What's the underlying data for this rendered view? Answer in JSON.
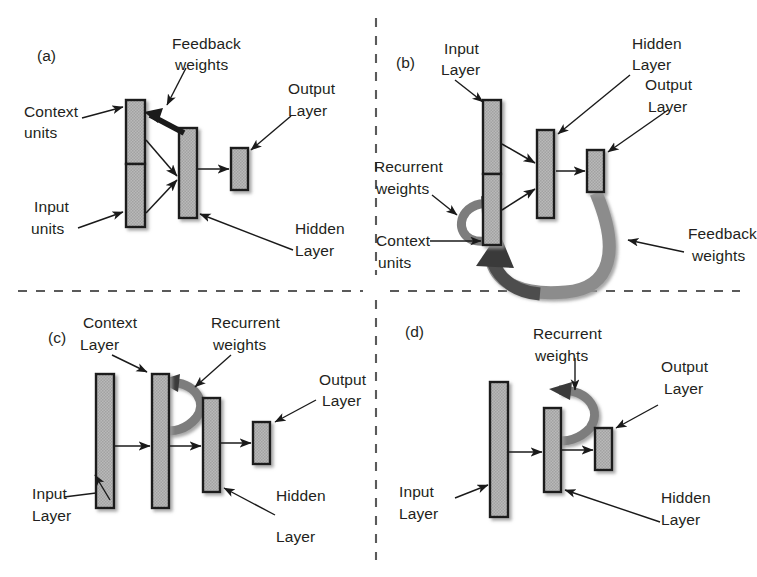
{
  "figure": {
    "background_color": "#ffffff",
    "ink_color": "#231f20",
    "box_fill": "#b3b3b3",
    "box_stroke": "#1a1a1a",
    "ribbon_light": "#8c8c8c",
    "ribbon_dark": "#4d4d4d",
    "divider_style": "dashed",
    "divider_color": "#5a5a5a"
  },
  "panels": [
    {
      "id": "(a)",
      "name": "jordan-network",
      "labels": {
        "context_units_l1": "Context",
        "context_units_l2": "units",
        "input_units_l1": "Input",
        "input_units_l2": "units",
        "feedback_weights_l1": "Feedback",
        "feedback_weights_l2": "weights",
        "output_layer_l1": "Output",
        "output_layer_l2": "Layer",
        "hidden_layer_l1": "Hidden",
        "hidden_layer_l2": "Layer"
      }
    },
    {
      "id": "(b)",
      "name": "jordan-elman-hybrid-network",
      "labels": {
        "input_layer_l1": "Input",
        "input_layer_l2": "Layer",
        "recurrent_weights_l1": "Recurrent",
        "recurrent_weights_l2": "weights",
        "context_units_l1": "Context",
        "context_units_l2": "units",
        "hidden_layer_l1": "Hidden",
        "hidden_layer_l2": "Layer",
        "output_layer_l1": "Output",
        "output_layer_l2": "Layer",
        "feedback_weights_l1": "Feedback",
        "feedback_weights_l2": "weights"
      }
    },
    {
      "id": "(c)",
      "name": "elman-network-context-layer",
      "labels": {
        "context_layer_l1": "Context",
        "context_layer_l2": "Layer",
        "recurrent_weights_l1": "Recurrent",
        "recurrent_weights_l2": "weights",
        "output_layer_l1": "Output",
        "output_layer_l2": "Layer",
        "input_layer_l1": "Input",
        "input_layer_l2": "Layer",
        "hidden_layer_l1": "Hidden",
        "hidden_layer_l2": "Layer"
      }
    },
    {
      "id": "(d)",
      "name": "simple-recurrent-network",
      "labels": {
        "recurrent_weights_l1": "Recurrent",
        "recurrent_weights_l2": "weights",
        "output_layer_l1": "Output",
        "output_layer_l2": "Layer",
        "input_layer_l1": "Input",
        "input_layer_l2": "Layer",
        "hidden_layer_l1": "Hidden",
        "hidden_layer_l2": "Layer"
      }
    }
  ]
}
